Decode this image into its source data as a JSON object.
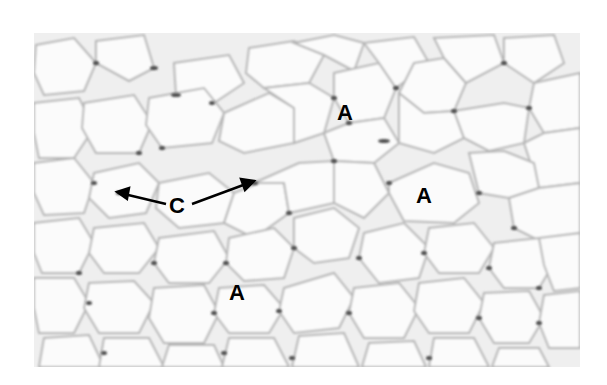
{
  "figure": {
    "type": "histology micrograph",
    "colors": {
      "background": "#ffffff",
      "cell_interior": "#fbfbfb",
      "cell_border": "#b8b8b8",
      "nuclei": "#4a4a4a",
      "label": "#000000"
    }
  },
  "labels": [
    {
      "id": "adipocyte-1",
      "text": "A",
      "x": 345,
      "y": 113
    },
    {
      "id": "adipocyte-2",
      "text": "A",
      "x": 424,
      "y": 196
    },
    {
      "id": "adipocyte-3",
      "text": "A",
      "x": 237,
      "y": 293
    },
    {
      "id": "capillary",
      "text": "C",
      "x": 177,
      "y": 206
    }
  ],
  "arrows": [
    {
      "id": "arrow-c-left",
      "from": [
        166,
        204
      ],
      "to": [
        117,
        193
      ]
    },
    {
      "id": "arrow-c-right",
      "from": [
        192,
        204
      ],
      "to": [
        253,
        182
      ]
    }
  ]
}
